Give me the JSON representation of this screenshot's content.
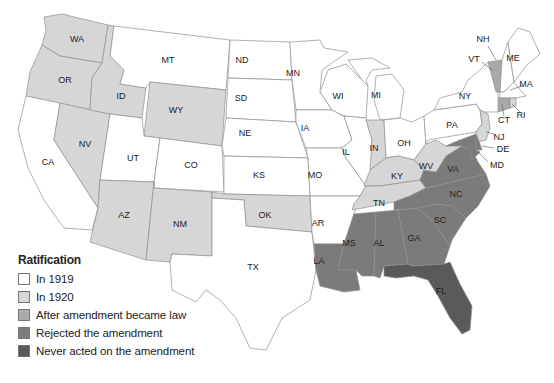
{
  "map": {
    "title": "Ratification of the 19th Amendment",
    "categories": {
      "1919": {
        "label": "In 1919",
        "color": "#ffffff"
      },
      "1920": {
        "label": "In 1920",
        "color": "#d6d6d6"
      },
      "after": {
        "label": "After amendment became law",
        "color": "#a9a9a9"
      },
      "rejected": {
        "label": "Rejected the amendment",
        "color": "#7b7b7b"
      },
      "never": {
        "label": "Never acted on the amendment",
        "color": "#5a5a5a"
      }
    },
    "states": {
      "WA": "1920",
      "OR": "1920",
      "CA": "1919",
      "NV": "1920",
      "ID": "1920",
      "MT": "1919",
      "WY": "1920",
      "UT": "1919",
      "CO": "1919",
      "AZ": "1920",
      "NM": "1920",
      "ND": "1919",
      "SD": "1919",
      "NE": "1919",
      "KS": "1919",
      "OK": "1920",
      "TX": "1919",
      "MN": "1919",
      "IA": "1919",
      "MO": "1919",
      "AR": "1919",
      "LA": "rejected",
      "WI": "1919",
      "IL": "1919",
      "MI": "1919",
      "IN": "1920",
      "OH": "1919",
      "KY": "1920",
      "TN": "1920",
      "MS": "rejected",
      "AL": "rejected",
      "GA": "rejected",
      "FL": "never",
      "SC": "rejected",
      "NC": "rejected",
      "VA": "rejected",
      "WV": "1920",
      "PA": "1919",
      "NY": "1919",
      "NJ": "1920",
      "DE": "rejected",
      "MD": "rejected",
      "VT": "after",
      "NH": "1919",
      "ME": "1919",
      "MA": "1919",
      "RI": "1920",
      "CT": "after"
    }
  },
  "legend": {
    "title": "Ratification",
    "items": [
      {
        "label": "In 1919",
        "color": "#ffffff"
      },
      {
        "label": "In 1920",
        "color": "#d6d6d6"
      },
      {
        "label": "After amendment became law",
        "color": "#a9a9a9"
      },
      {
        "label": "Rejected the amendment",
        "color": "#7b7b7b"
      },
      {
        "label": "Never acted on the amendment",
        "color": "#5a5a5a"
      }
    ]
  }
}
